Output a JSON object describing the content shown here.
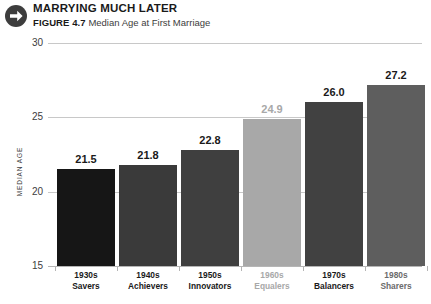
{
  "header": {
    "icon": "arrow-right-circle-icon",
    "title": "MARRYING MUCH LATER",
    "figure_label": "FIGURE 4.7",
    "figure_caption": "Median Age at First Marriage"
  },
  "chart_data": {
    "type": "bar",
    "title": "MARRYING MUCH LATER",
    "subtitle": "FIGURE 4.7  Median Age at First Marriage",
    "xlabel": "",
    "ylabel": "MEDIAN AGE",
    "ylim": [
      15,
      30
    ],
    "yticks": [
      "15",
      "20",
      "25",
      "30"
    ],
    "grid": true,
    "legend": "none",
    "categories": [
      {
        "decade": "1930s",
        "name": "Savers"
      },
      {
        "decade": "1940s",
        "name": "Achievers"
      },
      {
        "decade": "1950s",
        "name": "Innovators"
      },
      {
        "decade": "1960s",
        "name": "Equalers"
      },
      {
        "decade": "1970s",
        "name": "Balancers"
      },
      {
        "decade": "1980s",
        "name": "Sharers"
      }
    ],
    "values": [
      21.5,
      21.8,
      22.8,
      24.9,
      26.0,
      27.2
    ],
    "value_labels": [
      "21.5",
      "21.8",
      "22.8",
      "24.9",
      "26.0",
      "27.2"
    ],
    "bar_colors": [
      "#161616",
      "#3a3a3a",
      "#3f3f3f",
      "#a8a8a8",
      "#414141",
      "#5e5e5e"
    ],
    "label_colors": [
      "#1a1a1a",
      "#1a1a1a",
      "#1a1a1a",
      "#a8a8a8",
      "#1a1a1a",
      "#1a1a1a"
    ],
    "category_label_colors": [
      "#1a1a1a",
      "#1a1a1a",
      "#1a1a1a",
      "#a8a8a8",
      "#1a1a1a",
      "#6b6b6b"
    ],
    "highlight_category": "1960s Equalers"
  },
  "colors": {
    "background": "#ffffff",
    "gridline": "#c8c8c8",
    "text": "#231f20",
    "muted": "#a8a8a8"
  }
}
